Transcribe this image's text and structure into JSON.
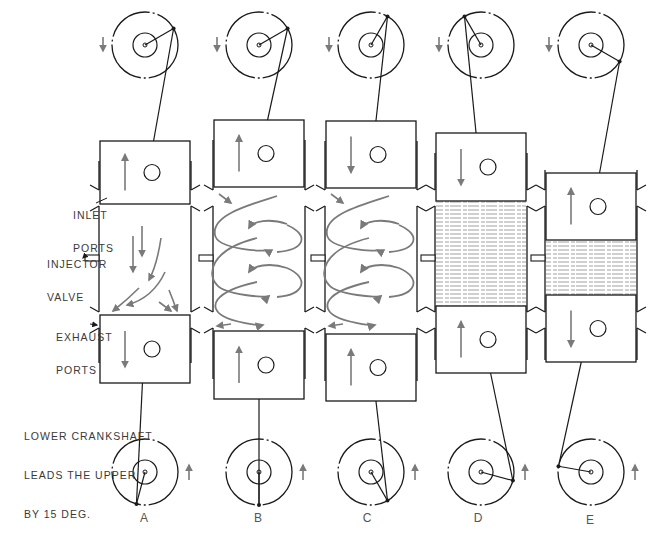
{
  "labels": {
    "inlet_ports": [
      "INLET",
      "PORTS"
    ],
    "injector_valve": [
      "INJECTOR",
      "VALVE"
    ],
    "exhaust_ports": [
      "EXHAUST",
      "PORTS"
    ],
    "note": [
      "LOWER CRANKSHAFT",
      "LEADS THE UPPER",
      "BY 15 DEG."
    ]
  },
  "stages": [
    {
      "id": "A",
      "label": "A",
      "cx": 145,
      "top_crank_deg": 60,
      "bot_crank_deg": 195,
      "upper_piston": {
        "top": 141,
        "bottom": 204,
        "dir": "up"
      },
      "lower_piston": {
        "top": 315,
        "bottom": 383,
        "dir": "down"
      },
      "chamber": "scavenge_flow"
    },
    {
      "id": "B",
      "label": "B",
      "cx": 259,
      "top_crank_deg": 60,
      "bot_crank_deg": 180,
      "upper_piston": {
        "top": 120,
        "bottom": 187,
        "dir": "up"
      },
      "lower_piston": {
        "top": 331,
        "bottom": 399,
        "dir": "up"
      },
      "chamber": "swirl"
    },
    {
      "id": "C",
      "label": "C",
      "cx": 371,
      "top_crank_deg": 30,
      "bot_crank_deg": 150,
      "upper_piston": {
        "top": 121,
        "bottom": 188,
        "dir": "down"
      },
      "lower_piston": {
        "top": 334,
        "bottom": 401,
        "dir": "up"
      },
      "chamber": "swirl"
    },
    {
      "id": "D",
      "label": "D",
      "cx": 481,
      "top_crank_deg": -30,
      "bot_crank_deg": 105,
      "upper_piston": {
        "top": 133,
        "bottom": 201,
        "dir": "down"
      },
      "lower_piston": {
        "top": 306,
        "bottom": 373,
        "dir": "up"
      },
      "chamber": "compressed"
    },
    {
      "id": "E",
      "label": "E",
      "cx": 591,
      "top_crank_deg": 120,
      "bot_crank_deg": -80,
      "upper_piston": {
        "top": 173,
        "bottom": 240,
        "dir": "up"
      },
      "lower_piston": {
        "top": 295,
        "bottom": 362,
        "dir": "down"
      },
      "chamber": "compressed"
    }
  ],
  "colors": {
    "line": "#1a1a1a",
    "flow_arrow": "#7a7a7a",
    "text": "#3a3a3a"
  },
  "rotation": {
    "top": "counterclockwise",
    "bottom": "clockwise"
  }
}
